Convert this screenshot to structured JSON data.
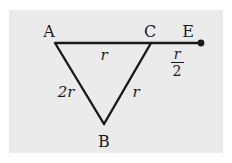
{
  "diagram": {
    "type": "geometry-triangle",
    "colors": {
      "background": "#ebebeb",
      "stroke": "#1a1a1a"
    },
    "vertices": {
      "A": {
        "label": "A",
        "x": 55,
        "y": 43
      },
      "B": {
        "label": "B",
        "x": 104,
        "y": 124
      },
      "C": {
        "label": "C",
        "x": 151,
        "y": 43
      },
      "E": {
        "label": "E",
        "x": 201,
        "y": 43
      }
    },
    "edge_labels": {
      "AC": "r",
      "AB": "2r",
      "BC": "r",
      "CE_numerator": "r",
      "CE_denominator": "2"
    }
  }
}
